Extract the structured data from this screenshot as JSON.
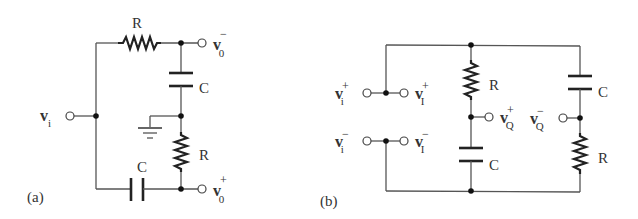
{
  "figure": {
    "panels": [
      {
        "id": "a",
        "caption": "(a)",
        "components": {
          "top_resistor": "R",
          "right_capacitor": "C",
          "right_resistor": "R",
          "bottom_capacitor": "C"
        },
        "terminals": {
          "input": {
            "base": "v",
            "sub": "i",
            "sup": ""
          },
          "output_minus": {
            "base": "v",
            "sub": "0",
            "sup": "−"
          },
          "output_plus": {
            "base": "v",
            "sub": "0",
            "sup": "+"
          }
        },
        "ground_symbol": true
      },
      {
        "id": "b",
        "caption": "(b)",
        "components": {
          "middle_resistor": "R",
          "middle_capacitor": "C",
          "right_capacitor": "C",
          "right_resistor": "R"
        },
        "terminals": {
          "input_plus": {
            "base": "v",
            "sub": "i",
            "sup": "+"
          },
          "input_minus": {
            "base": "v",
            "sub": "i",
            "sup": "−"
          },
          "inphase_plus": {
            "base": "v",
            "sub": "I",
            "sup": "+"
          },
          "inphase_minus": {
            "base": "v",
            "sub": "I",
            "sup": "−"
          },
          "quad_plus": {
            "base": "v",
            "sub": "Q",
            "sup": "+"
          },
          "quad_minus": {
            "base": "v",
            "sub": "Q",
            "sup": "−"
          }
        }
      }
    ],
    "colors": {
      "wire": "#555555",
      "component": "#222222",
      "text": "#333333",
      "background": "#ffffff"
    }
  }
}
